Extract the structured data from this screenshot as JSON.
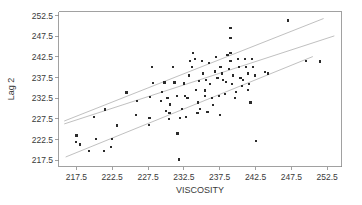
{
  "chart_data": {
    "type": "scatter",
    "title": "",
    "xlabel": "VISCOSITY",
    "ylabel": "Lag 2",
    "xlim": [
      215.0,
      254.5
    ],
    "ylim": [
      216.0,
      253.5
    ],
    "xticks": [
      217.5,
      222.5,
      227.5,
      232.5,
      237.5,
      242.5,
      247.5,
      252.5
    ],
    "yticks": [
      217.5,
      222.5,
      227.5,
      232.5,
      237.5,
      242.5,
      247.5,
      252.5
    ],
    "xtick_labels": [
      "217.5",
      "222.5",
      "227.5",
      "232.5",
      "237.5",
      "242.5",
      "247.5",
      "252.5"
    ],
    "ytick_labels": [
      "217.5",
      "222.5",
      "227.5",
      "232.5",
      "237.5",
      "242.5",
      "247.5",
      "252.5"
    ],
    "grid": false,
    "legend": "none",
    "marker": "square",
    "marker_color": "#2b2b2b",
    "line_color": "#b9b9b9",
    "frame_color": "#8a8a8a",
    "x": [
      217.4,
      217.5,
      218.0,
      219.3,
      220.0,
      220.2,
      221.3,
      221.5,
      222.3,
      222.5,
      223.2,
      224.5,
      225.8,
      226.0,
      227.6,
      227.7,
      227.8,
      228.0,
      228.2,
      229.3,
      229.5,
      229.8,
      230.0,
      230.2,
      230.4,
      230.5,
      230.6,
      231.0,
      231.2,
      231.5,
      231.6,
      231.8,
      232.0,
      232.2,
      232.5,
      232.6,
      232.8,
      233.0,
      233.2,
      233.4,
      233.6,
      233.8,
      234.0,
      234.2,
      234.4,
      234.5,
      234.6,
      234.8,
      235.0,
      235.2,
      235.4,
      235.5,
      235.6,
      235.8,
      236.0,
      236.2,
      236.4,
      236.6,
      236.8,
      237.0,
      237.2,
      237.4,
      237.5,
      237.6,
      237.8,
      238.0,
      238.2,
      238.4,
      238.6,
      238.8,
      239.0,
      239.0,
      239.0,
      239.0,
      239.2,
      239.4,
      239.6,
      239.8,
      240.0,
      240.2,
      240.4,
      240.6,
      240.8,
      241.0,
      241.2,
      241.4,
      241.5,
      241.6,
      241.8,
      242.0,
      242.2,
      242.4,
      242.6,
      243.8,
      244.2,
      247.0,
      249.5,
      251.5
    ],
    "y": [
      222.0,
      223.5,
      221.3,
      219.8,
      227.9,
      222.7,
      219.8,
      229.8,
      220.7,
      222.7,
      225.9,
      233.9,
      228.5,
      231.9,
      226.0,
      227.8,
      232.9,
      240.0,
      236.2,
      231.8,
      234.0,
      236.3,
      229.5,
      232.5,
      227.5,
      228.9,
      231.0,
      240.0,
      236.3,
      233.0,
      224.0,
      217.7,
      227.8,
      230.0,
      236.1,
      233.0,
      228.0,
      232.6,
      238.0,
      241.5,
      240.0,
      243.5,
      242.0,
      234.6,
      229.0,
      231.5,
      236.6,
      230.0,
      241.5,
      238.5,
      234.4,
      233.0,
      237.0,
      229.2,
      241.0,
      236.0,
      232.5,
      230.8,
      239.0,
      242.5,
      237.5,
      233.0,
      228.5,
      240.0,
      238.5,
      237.0,
      233.5,
      236.5,
      243.0,
      239.5,
      249.5,
      247.0,
      243.5,
      241.5,
      236.0,
      238.0,
      232.5,
      234.0,
      242.0,
      240.0,
      237.5,
      235.5,
      237.0,
      242.0,
      240.0,
      238.5,
      234.5,
      236.0,
      231.5,
      242.0,
      240.0,
      238.0,
      222.2,
      238.8,
      238.5,
      251.3,
      241.5,
      241.4
    ],
    "fit_line": {
      "x0": 215.8,
      "y0": 226.3,
      "x1": 253.5,
      "y1": 247.6
    },
    "upper_band": {
      "x0": 215.8,
      "y0": 227.0,
      "x1": 252.0,
      "y1": 251.8
    },
    "lower_band": {
      "x0": 216.0,
      "y0": 218.3,
      "x1": 250.5,
      "y1": 242.6
    }
  }
}
